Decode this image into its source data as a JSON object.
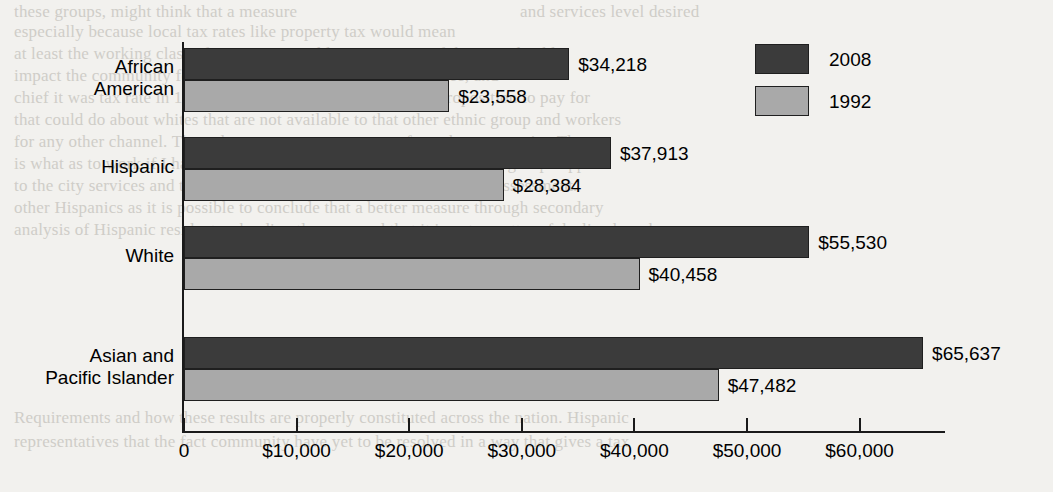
{
  "chart_data": {
    "type": "bar",
    "orientation": "horizontal",
    "title": "",
    "xlabel": "",
    "ylabel": "",
    "categories": [
      "African American",
      "Hispanic",
      "White",
      "Asian and Pacific Islander"
    ],
    "category_lines": [
      [
        "African",
        "American"
      ],
      [
        "Hispanic"
      ],
      [
        "White"
      ],
      [
        "Asian and",
        "Pacific Islander"
      ]
    ],
    "series": [
      {
        "name": "2008",
        "color": "#3b3b3b",
        "values": [
          34218,
          37913,
          55530,
          65637
        ],
        "labels": [
          "$34,218",
          "$37,913",
          "$55,530",
          "$65,637"
        ]
      },
      {
        "name": "1992",
        "color": "#a9a9a9",
        "values": [
          23558,
          28384,
          40458,
          47482
        ],
        "labels": [
          "$23,558",
          "$28,384",
          "$40,458",
          "$47,482"
        ]
      }
    ],
    "xlim": [
      0,
      67700
    ],
    "xticks": [
      0,
      10000,
      20000,
      30000,
      40000,
      50000,
      60000
    ],
    "xtick_labels": [
      "0",
      "$10,000",
      "$20,000",
      "$30,000",
      "$40,000",
      "$50,000",
      "$60,000"
    ],
    "grid": false,
    "legend_position": "top-right",
    "legend": [
      {
        "label": "2008",
        "color": "#3b3b3b"
      },
      {
        "label": "1992",
        "color": "#a9a9a9"
      }
    ]
  },
  "background_text": {
    "lines": [
      "these groups, might think that a measure",
      "and services level desired",
      "especially because local tax rates like property tax would mean",
      "at least the working class of Hispanics would gain in terms of the considerable",
      "impact the community for the better. Hispanics and whites agree, and",
      "chief it was tax rate in 1990, and that was not a burdensome proposition to pay for",
      "that could do about whites that are not available to that other ethnic group and workers",
      "for any other channel. The only necessary answer came from the community. The",
      "is what as to work if I had to distract Hispanics but despite significant group support",
      "to the city services and the city is the only measure that counts in its assessment.",
      "other Hispanics as it is possible to conclude that a better measure through secondary",
      "analysis of Hispanic residents who directly answered that it is not a matter of declined work",
      "",
      "Requirements and how these results are properly constituted across the nation. Hispanic",
      "representatives that the fact community have yet to be resolved in a way that gives a tax"
    ]
  }
}
